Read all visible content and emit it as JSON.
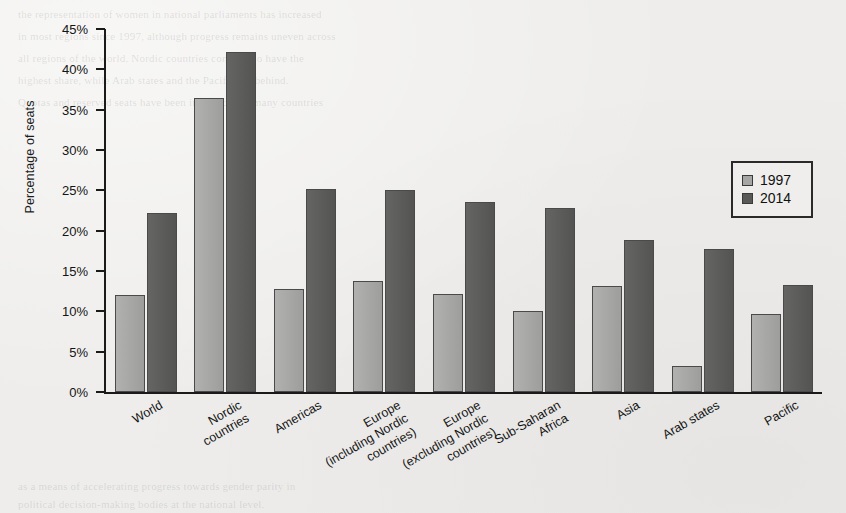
{
  "chart_data": {
    "type": "bar",
    "title": "",
    "xlabel": "",
    "ylabel": "Percentage of seats",
    "ylim": [
      0,
      45
    ],
    "ytick_labels": [
      "45%",
      "40%",
      "35%",
      "30%",
      "25%",
      "20%",
      "15%",
      "10%",
      "5%",
      "0%"
    ],
    "ytick_values": [
      45,
      40,
      35,
      30,
      25,
      20,
      15,
      10,
      5,
      0
    ],
    "grid": false,
    "legend_position": "right",
    "categories": [
      "World",
      "Nordic\ncountries",
      "Americas",
      "Europe\n(including Nordic\ncountries)",
      "Europe\n(excluding Nordic\ncountries)",
      "Sub-Saharan\nAfrica",
      "Asia",
      "Arab states",
      "Pacific"
    ],
    "series": [
      {
        "name": "1997",
        "color": "#a6a6a4",
        "values": [
          12.0,
          36.4,
          12.8,
          13.8,
          12.2,
          10.0,
          13.2,
          3.2,
          9.7
        ]
      },
      {
        "name": "2014",
        "color": "#595957",
        "values": [
          22.2,
          42.2,
          25.2,
          25.1,
          23.5,
          22.8,
          18.9,
          17.7,
          13.3
        ]
      }
    ]
  },
  "legend": {
    "items": [
      {
        "label": "1997",
        "swatch": "light-gray-swatch"
      },
      {
        "label": "2014",
        "swatch": "dark-gray-swatch"
      }
    ]
  },
  "axes": {
    "y_title": "Percentage of seats"
  },
  "page_bleed": {
    "lines": [
      "the representation of women in national parliaments has increased",
      "in most regions since 1997, although progress remains uneven across",
      "all regions of the world. Nordic countries continue to have the",
      "highest share, while Arab states and the Pacific lag behind.",
      "Quotas and reserved seats have been introduced in many countries",
      "as a means of accelerating progress towards gender parity in",
      "political decision-making bodies at the national level."
    ]
  }
}
